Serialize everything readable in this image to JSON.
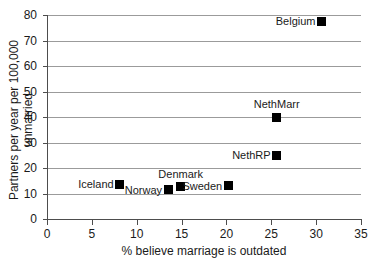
{
  "chart_data": {
    "type": "scatter",
    "title": "",
    "xlabel": "% believe marriage is outdated",
    "ylabel": "Partners per year per 100,000 unmarried",
    "xlim": [
      0,
      35
    ],
    "ylim": [
      0,
      80
    ],
    "xticks": [
      0,
      5,
      10,
      15,
      20,
      25,
      30,
      35
    ],
    "yticks": [
      0,
      10,
      20,
      30,
      40,
      50,
      60,
      70,
      80
    ],
    "grid": "horizontal",
    "legend": "none",
    "marker_color": "#000000",
    "gridline_color": "#9b9b9b",
    "axis_color": "#4d4d4d",
    "points": [
      {
        "label": "Iceland",
        "x": 8.1,
        "y": 13.7,
        "label_pos": "left"
      },
      {
        "label": "Norway",
        "x": 13.5,
        "y": 11.4,
        "label_pos": "left"
      },
      {
        "label": "Denmark",
        "x": 14.9,
        "y": 12.6,
        "label_pos": "above"
      },
      {
        "label": "Sweden",
        "x": 20.2,
        "y": 13.0,
        "label_pos": "left"
      },
      {
        "label": "NethRP",
        "x": 25.6,
        "y": 25.0,
        "label_pos": "left"
      },
      {
        "label": "NethMarr",
        "x": 25.6,
        "y": 40.0,
        "label_pos": "above"
      },
      {
        "label": "Belgium",
        "x": 30.6,
        "y": 77.5,
        "label_pos": "left"
      }
    ]
  }
}
